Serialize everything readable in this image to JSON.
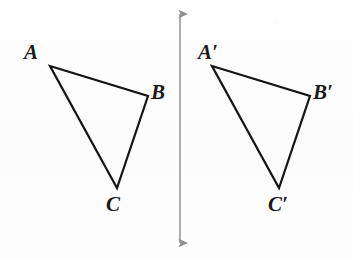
{
  "figure": {
    "background_color": "#fdfdfd",
    "stroke_color": "#141414",
    "mirror_line_color": "#9a9a9a",
    "label_color": "#1a1a1a"
  },
  "mirror_line": {
    "name": "line-of-reflection",
    "x": 180,
    "y_top": 8,
    "y_bottom": 249,
    "arrowheads": "both",
    "stroke_width": 1.6
  },
  "triangles": [
    {
      "name": "triangle-abc",
      "stroke_width": 2.2,
      "vertices": [
        {
          "label": "A",
          "x": 50,
          "y": 66,
          "label_x": 24,
          "label_y": 42
        },
        {
          "label": "B",
          "x": 148,
          "y": 96,
          "label_x": 151,
          "label_y": 82
        },
        {
          "label": "C",
          "x": 117,
          "y": 188,
          "label_x": 106,
          "label_y": 194
        }
      ]
    },
    {
      "name": "triangle-abc-prime",
      "stroke_width": 2.2,
      "vertices": [
        {
          "label": "A",
          "prime": "′",
          "x": 212,
          "y": 66,
          "label_x": 198,
          "label_y": 42
        },
        {
          "label": "B",
          "prime": "′",
          "x": 310,
          "y": 96,
          "label_x": 313,
          "label_y": 82
        },
        {
          "label": "C",
          "prime": "′",
          "x": 279,
          "y": 188,
          "label_x": 268,
          "label_y": 194
        }
      ]
    }
  ],
  "labels": {
    "a": "A",
    "b": "B",
    "c": "C",
    "a_prime_base": "A",
    "b_prime_base": "B",
    "c_prime_base": "C",
    "prime_mark": "′"
  }
}
